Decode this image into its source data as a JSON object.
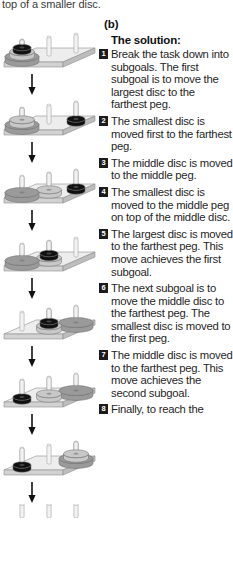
{
  "top_caption": "top of a smaller disc.",
  "panel_label": "(b)",
  "solution": {
    "title": "The solution:",
    "steps": [
      {
        "num": "1",
        "text": "Break the task down into subgoals. The first subgoal is to move the largest disc to the farthest peg."
      },
      {
        "num": "2",
        "text": "The smallest disc is moved first to the farthest peg."
      },
      {
        "num": "3",
        "text": "The middle disc is moved to the middle peg."
      },
      {
        "num": "4",
        "text": "The smallest disc is moved to the middle peg on top of the middle disc."
      },
      {
        "num": "5",
        "text": "The largest disc is moved to the farthest peg. This move achieves the first subgoal."
      },
      {
        "num": "6",
        "text": "The next subgoal is to move the middle disc to the farthest peg. The smallest disc is moved to the first peg."
      },
      {
        "num": "7",
        "text": "The middle disc is moved to the farthest peg. This move achieves the second subgoal."
      },
      {
        "num": "8",
        "text": "Finally, to reach the"
      }
    ]
  },
  "diagram": {
    "type": "tower-of-hanoi-sequence",
    "peg_count": 3,
    "disc_names": [
      "largest",
      "middle",
      "smallest"
    ],
    "disc_colors": {
      "largest": "#9a9a9a",
      "middle": "#c8c8c8",
      "smallest": "#111111"
    },
    "board_color": "#e3e3e3",
    "peg_color": "#e8e8e8",
    "arrow_color": "#111111",
    "states": [
      {
        "label": "start",
        "pegs": [
          [
            "largest",
            "middle",
            "smallest"
          ],
          [],
          []
        ]
      },
      {
        "label": "after-move-1",
        "pegs": [
          [
            "largest",
            "middle"
          ],
          [],
          [
            "smallest"
          ]
        ]
      },
      {
        "label": "after-move-2",
        "pegs": [
          [
            "largest"
          ],
          [
            "middle"
          ],
          [
            "smallest"
          ]
        ]
      },
      {
        "label": "after-move-3",
        "pegs": [
          [
            "largest"
          ],
          [
            "middle",
            "smallest"
          ],
          []
        ]
      },
      {
        "label": "after-move-4",
        "pegs": [
          [],
          [
            "middle",
            "smallest"
          ],
          [
            "largest"
          ]
        ]
      },
      {
        "label": "after-move-5",
        "pegs": [
          [
            "smallest"
          ],
          [
            "middle"
          ],
          [
            "largest"
          ]
        ]
      },
      {
        "label": "after-move-6",
        "pegs": [
          [
            "smallest"
          ],
          [],
          [
            "largest",
            "middle"
          ]
        ]
      },
      {
        "label": "final-clipped",
        "pegs": [
          [],
          [],
          []
        ]
      }
    ]
  }
}
